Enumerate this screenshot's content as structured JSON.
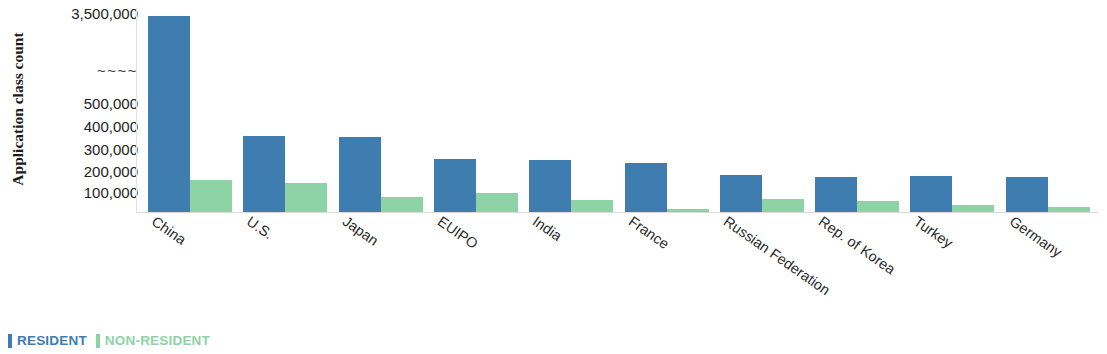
{
  "chart_data": {
    "type": "bar",
    "title": "",
    "xlabel": "",
    "ylabel": "Application class count",
    "categories": [
      "China",
      "U.S.",
      "Japan",
      "EUIPO",
      "India",
      "France",
      "Russian Federation",
      "Rep. of Korea",
      "Turkey",
      "Germany"
    ],
    "series": [
      {
        "name": "RESIDENT",
        "color": "#3f7cb0",
        "values": [
          3500000,
          360000,
          355000,
          250000,
          245000,
          230000,
          175000,
          165000,
          170000,
          165000
        ]
      },
      {
        "name": "NON-RESIDENT",
        "color": "#8ed3a6",
        "values": [
          150000,
          135000,
          70000,
          90000,
          55000,
          15000,
          60000,
          50000,
          35000,
          25000
        ]
      }
    ],
    "y_tick_labels": [
      "3,500,000",
      "~~~~",
      "500,000",
      "400,000",
      "300,000",
      "200,000",
      "100,000"
    ],
    "y_axis_break": true,
    "y_axis_break_symbol": "~~~~",
    "ylim": [
      0,
      3500000
    ],
    "grid": false,
    "legend_position": "bottom-left",
    "legend_entries": [
      "RESIDENT",
      "NON-RESIDENT"
    ]
  },
  "axis": {
    "y_title": "Application class count",
    "ticks": [
      {
        "label": "3,500,000",
        "top": 6
      },
      {
        "label": "~~~~",
        "top": 63
      },
      {
        "label": "500,000",
        "top": 96
      },
      {
        "label": "400,000",
        "top": 119
      },
      {
        "label": "300,000",
        "top": 142
      },
      {
        "label": "200,000",
        "top": 164
      },
      {
        "label": "100,000",
        "top": 185
      }
    ]
  },
  "legend": {
    "resident_label": "RESIDENT",
    "nonresident_label": "NON-RESIDENT",
    "resident_color": "#3f7cb0",
    "nonresident_color": "#8ed3a6"
  }
}
